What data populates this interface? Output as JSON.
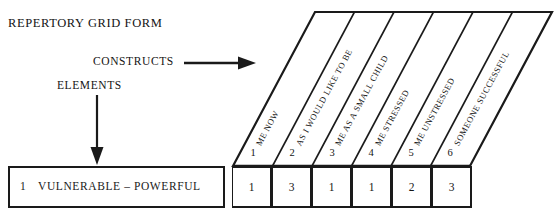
{
  "form": {
    "title": "REPERTORY GRID FORM",
    "constructs_label": "CONSTRUCTS",
    "elements_label": "ELEMENTS",
    "constructs_arrow_icon": "arrow-right-icon",
    "elements_arrow_icon": "arrow-down-icon"
  },
  "grid": {
    "element_columns": [
      {
        "number": "1",
        "name": "ME NOW"
      },
      {
        "number": "2",
        "name": "AS I WOULD LIKE TO BE"
      },
      {
        "number": "3",
        "name": "ME AS A SMALL CHILD"
      },
      {
        "number": "4",
        "name": "ME STRESSED"
      },
      {
        "number": "5",
        "name": "ME UNSTRESSED"
      },
      {
        "number": "6",
        "name": "SOMEONE SUCCESSFUL"
      }
    ],
    "construct_rows": [
      {
        "index": "1",
        "pole_text": "VULNERABLE – POWERFUL",
        "ratings": [
          "1",
          "3",
          "1",
          "1",
          "2",
          "3"
        ]
      }
    ]
  },
  "colors": {
    "ink": "#1a1a1a",
    "paper": "#ffffff"
  }
}
